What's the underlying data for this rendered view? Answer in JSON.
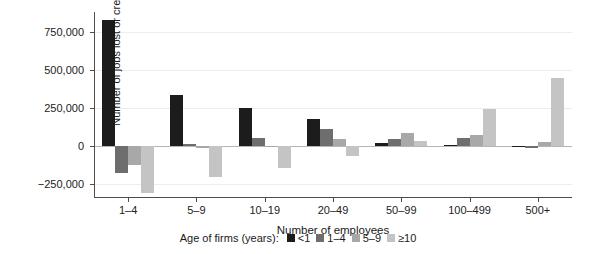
{
  "top_sliver_text": "",
  "chart_data": {
    "type": "bar",
    "title": "",
    "xlabel": "Number of employees",
    "ylabel": "Number of jobs lost or created",
    "categories": [
      "1–4",
      "5–9",
      "10–19",
      "20–49",
      "50–99",
      "100–499",
      "500+"
    ],
    "legend_title": "Age of firms (years):",
    "legend_position": "bottom",
    "grid": true,
    "ylim": [
      -340000,
      880000
    ],
    "yticks": [
      -250000,
      0,
      250000,
      500000,
      750000
    ],
    "ytick_labels": [
      "−250,000",
      "0",
      "250,000",
      "500,000",
      "750,000"
    ],
    "series": [
      {
        "name": "<1",
        "color": "#1c1c1c",
        "values": [
          830000,
          335000,
          250000,
          180000,
          18000,
          6000,
          2000
        ]
      },
      {
        "name": "1–4",
        "color": "#6e6e6e",
        "values": [
          -175000,
          12000,
          55000,
          110000,
          50000,
          55000,
          -12000
        ]
      },
      {
        "name": "5–9",
        "color": "#a8a8a8",
        "values": [
          -125000,
          -15000,
          2000,
          45000,
          85000,
          75000,
          30000
        ]
      },
      {
        "name": "≥10",
        "color": "#c4c4c4",
        "values": [
          -310000,
          -200000,
          -140000,
          -65000,
          35000,
          245000,
          450000
        ]
      }
    ]
  },
  "colors": {
    "axis": "#4d4d4d",
    "grid": "#ededed",
    "zero_line": "#b5b5b5",
    "text": "#1a1a1a",
    "background": "#ffffff"
  }
}
